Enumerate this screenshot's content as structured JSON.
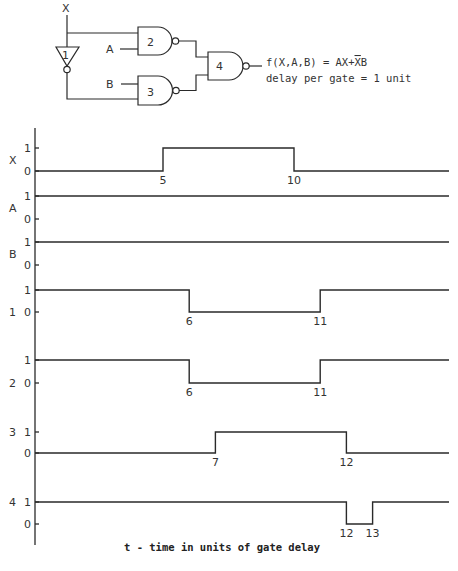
{
  "circuit": {
    "input_labels": {
      "x": "X",
      "a": "A",
      "b": "B"
    },
    "gates": [
      {
        "id": "1",
        "type": "NOT",
        "label": "1"
      },
      {
        "id": "2",
        "type": "NAND",
        "label": "2"
      },
      {
        "id": "3",
        "type": "NAND",
        "label": "3"
      },
      {
        "id": "4",
        "type": "NAND",
        "label": "4"
      }
    ],
    "function_text": "f(X,A,B) = AX+",
    "function_overbar_char": "X",
    "function_tail": "B",
    "delay_text": "delay per gate = 1 unit"
  },
  "chart_data": {
    "type": "line",
    "subtype": "digital-timing-diagram",
    "title": "",
    "xlabel": "t - time in units of gate delay",
    "x_range": [
      0,
      15.8
    ],
    "level_labels": {
      "high": "1",
      "low": "0"
    },
    "signals": [
      {
        "name": "X",
        "label": "X",
        "initial": 0,
        "transitions": [
          {
            "t": 5,
            "to": 1,
            "label": "5"
          },
          {
            "t": 10,
            "to": 0,
            "label": "10"
          }
        ]
      },
      {
        "name": "A",
        "label": "A",
        "initial": 1,
        "transitions": []
      },
      {
        "name": "B",
        "label": "B",
        "initial": 1,
        "transitions": []
      },
      {
        "name": "gate1",
        "label": "1",
        "initial": 1,
        "transitions": [
          {
            "t": 6,
            "to": 0,
            "label": "6"
          },
          {
            "t": 11,
            "to": 1,
            "label": "11"
          }
        ]
      },
      {
        "name": "gate2",
        "label": "2",
        "initial": 1,
        "transitions": [
          {
            "t": 6,
            "to": 0,
            "label": "6"
          },
          {
            "t": 11,
            "to": 1,
            "label": "11"
          }
        ]
      },
      {
        "name": "gate3",
        "label": "3",
        "initial": 0,
        "transitions": [
          {
            "t": 7,
            "to": 1,
            "label": "7"
          },
          {
            "t": 12,
            "to": 0,
            "label": "12"
          }
        ]
      },
      {
        "name": "gate4",
        "label": "4",
        "initial": 1,
        "transitions": [
          {
            "t": 12,
            "to": 0,
            "label": "12"
          },
          {
            "t": 13,
            "to": 1,
            "label": "13"
          }
        ]
      }
    ]
  }
}
